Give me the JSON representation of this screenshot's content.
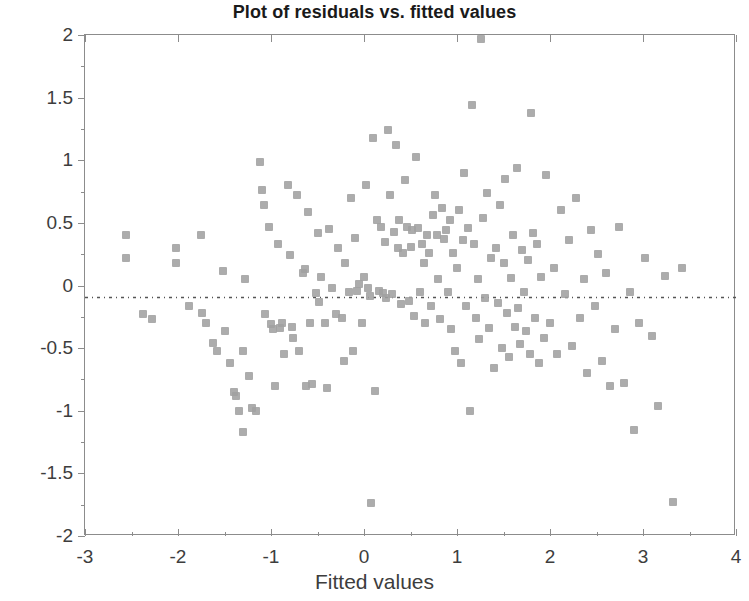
{
  "chart_data": {
    "type": "scatter",
    "title": "Plot of residuals vs. fitted values",
    "xlabel": "Fitted values",
    "ylabel": "Residuals",
    "xlim": [
      -3,
      4
    ],
    "ylim": [
      -2,
      2
    ],
    "xticks": [
      -3,
      -2,
      -1,
      0,
      1,
      2,
      3,
      4
    ],
    "xticklabels": [
      "-3",
      "-2",
      "-1",
      "0",
      "1",
      "2",
      "3",
      "4"
    ],
    "yticks": [
      -2,
      -1.5,
      -1,
      -0.5,
      0,
      0.5,
      1,
      1.5,
      2
    ],
    "yticklabels": [
      "-2",
      "-1.5",
      "-1",
      "-0.5",
      "0",
      "0.5",
      "1",
      "1.5",
      "2"
    ],
    "grid": false,
    "legend": null,
    "marker": "square",
    "marker_color": "#a0a0a0",
    "marker_size": 8,
    "reference_line": {
      "y": 0,
      "style": "dash-dot",
      "color": "#555555"
    },
    "n_points": 196,
    "points": [
      [
        -2.56,
        0.4
      ],
      [
        -2.56,
        0.22
      ],
      [
        -2.38,
        -0.23
      ],
      [
        -2.28,
        -0.27
      ],
      [
        -2.02,
        0.3
      ],
      [
        -2.02,
        0.18
      ],
      [
        -1.88,
        -0.16
      ],
      [
        -1.75,
        0.4
      ],
      [
        -1.74,
        -0.22
      ],
      [
        -1.7,
        -0.3
      ],
      [
        -1.62,
        -0.46
      ],
      [
        -1.58,
        -0.52
      ],
      [
        -1.52,
        0.12
      ],
      [
        -1.5,
        -0.36
      ],
      [
        -1.44,
        -0.62
      ],
      [
        -1.4,
        -0.85
      ],
      [
        -1.38,
        -0.88
      ],
      [
        -1.34,
        -1.0
      ],
      [
        -1.3,
        -1.17
      ],
      [
        -1.3,
        -0.52
      ],
      [
        -1.28,
        0.05
      ],
      [
        -1.24,
        -0.72
      ],
      [
        -1.2,
        -0.98
      ],
      [
        -1.16,
        -1.0
      ],
      [
        -1.12,
        0.99
      ],
      [
        -1.1,
        0.76
      ],
      [
        -1.08,
        0.64
      ],
      [
        -1.06,
        -0.23
      ],
      [
        -1.02,
        0.47
      ],
      [
        -1.0,
        -0.31
      ],
      [
        -0.98,
        -0.35
      ],
      [
        -0.96,
        -0.8
      ],
      [
        -0.93,
        0.33
      ],
      [
        -0.9,
        -0.34
      ],
      [
        -0.88,
        -0.3
      ],
      [
        -0.86,
        -0.55
      ],
      [
        -0.82,
        0.8
      ],
      [
        -0.8,
        0.24
      ],
      [
        -0.78,
        -0.33
      ],
      [
        -0.76,
        -0.42
      ],
      [
        -0.72,
        0.72
      ],
      [
        -0.7,
        -0.52
      ],
      [
        -0.66,
        0.1
      ],
      [
        -0.64,
        0.13
      ],
      [
        -0.62,
        -0.8
      ],
      [
        -0.6,
        0.59
      ],
      [
        -0.58,
        -0.3
      ],
      [
        -0.56,
        -0.79
      ],
      [
        -0.52,
        -0.06
      ],
      [
        -0.5,
        0.42
      ],
      [
        -0.48,
        -0.13
      ],
      [
        -0.46,
        0.07
      ],
      [
        -0.42,
        -0.3
      ],
      [
        -0.4,
        -0.82
      ],
      [
        -0.38,
        0.45
      ],
      [
        -0.34,
        -0.02
      ],
      [
        -0.3,
        -0.23
      ],
      [
        -0.28,
        0.3
      ],
      [
        -0.24,
        -0.26
      ],
      [
        -0.22,
        -0.6
      ],
      [
        -0.2,
        0.18
      ],
      [
        -0.16,
        -0.05
      ],
      [
        -0.14,
        0.7
      ],
      [
        -0.12,
        -0.52
      ],
      [
        -0.1,
        0.38
      ],
      [
        -0.08,
        -0.04
      ],
      [
        -0.05,
        0.01
      ],
      [
        -0.02,
        -0.3
      ],
      [
        0.0,
        0.07
      ],
      [
        0.02,
        0.8
      ],
      [
        0.04,
        -0.02
      ],
      [
        0.06,
        -0.08
      ],
      [
        0.08,
        -1.74
      ],
      [
        0.1,
        1.18
      ],
      [
        0.12,
        -0.84
      ],
      [
        0.14,
        0.52
      ],
      [
        0.16,
        -0.04
      ],
      [
        0.18,
        0.47
      ],
      [
        0.2,
        -0.06
      ],
      [
        0.22,
        0.35
      ],
      [
        0.24,
        -0.1
      ],
      [
        0.26,
        1.24
      ],
      [
        0.28,
        0.72
      ],
      [
        0.3,
        -0.07
      ],
      [
        0.32,
        0.43
      ],
      [
        0.34,
        1.12
      ],
      [
        0.36,
        0.3
      ],
      [
        0.38,
        0.52
      ],
      [
        0.4,
        -0.15
      ],
      [
        0.42,
        0.26
      ],
      [
        0.44,
        0.84
      ],
      [
        0.46,
        0.47
      ],
      [
        0.48,
        -0.12
      ],
      [
        0.5,
        0.31
      ],
      [
        0.52,
        0.44
      ],
      [
        0.54,
        -0.24
      ],
      [
        0.56,
        1.03
      ],
      [
        0.58,
        0.46
      ],
      [
        0.6,
        -0.05
      ],
      [
        0.62,
        0.33
      ],
      [
        0.64,
        0.18
      ],
      [
        0.66,
        -0.3
      ],
      [
        0.68,
        0.4
      ],
      [
        0.7,
        0.26
      ],
      [
        0.72,
        -0.16
      ],
      [
        0.74,
        0.56
      ],
      [
        0.76,
        0.72
      ],
      [
        0.78,
        0.4
      ],
      [
        0.8,
        0.05
      ],
      [
        0.82,
        -0.27
      ],
      [
        0.84,
        0.62
      ],
      [
        0.86,
        0.37
      ],
      [
        0.88,
        0.44
      ],
      [
        0.9,
        -0.05
      ],
      [
        0.92,
        0.52
      ],
      [
        0.94,
        -0.35
      ],
      [
        0.96,
        0.26
      ],
      [
        0.98,
        -0.52
      ],
      [
        1.0,
        0.14
      ],
      [
        1.02,
        0.6
      ],
      [
        1.04,
        -0.62
      ],
      [
        1.06,
        0.36
      ],
      [
        1.08,
        0.9
      ],
      [
        1.1,
        -0.16
      ],
      [
        1.12,
        0.46
      ],
      [
        1.14,
        -1.0
      ],
      [
        1.16,
        1.44
      ],
      [
        1.18,
        0.33
      ],
      [
        1.2,
        -0.26
      ],
      [
        1.22,
        0.05
      ],
      [
        1.24,
        -0.43
      ],
      [
        1.26,
        1.97
      ],
      [
        1.28,
        0.54
      ],
      [
        1.3,
        -0.1
      ],
      [
        1.32,
        0.74
      ],
      [
        1.34,
        -0.34
      ],
      [
        1.36,
        0.22
      ],
      [
        1.4,
        -0.66
      ],
      [
        1.42,
        0.3
      ],
      [
        1.44,
        -0.14
      ],
      [
        1.46,
        0.64
      ],
      [
        1.48,
        -0.5
      ],
      [
        1.5,
        0.18
      ],
      [
        1.52,
        0.85
      ],
      [
        1.54,
        -0.22
      ],
      [
        1.56,
        -0.57
      ],
      [
        1.58,
        0.06
      ],
      [
        1.6,
        0.4
      ],
      [
        1.62,
        -0.33
      ],
      [
        1.64,
        0.94
      ],
      [
        1.66,
        -0.18
      ],
      [
        1.68,
        -0.47
      ],
      [
        1.7,
        0.28
      ],
      [
        1.72,
        -0.05
      ],
      [
        1.74,
        -0.36
      ],
      [
        1.76,
        0.2
      ],
      [
        1.78,
        -0.55
      ],
      [
        1.8,
        1.38
      ],
      [
        1.82,
        0.42
      ],
      [
        1.84,
        -0.26
      ],
      [
        1.86,
        0.33
      ],
      [
        1.88,
        -0.62
      ],
      [
        1.9,
        0.07
      ],
      [
        1.94,
        -0.42
      ],
      [
        1.96,
        0.88
      ],
      [
        2.0,
        -0.3
      ],
      [
        2.04,
        0.14
      ],
      [
        2.08,
        -0.55
      ],
      [
        2.12,
        0.6
      ],
      [
        2.16,
        -0.07
      ],
      [
        2.2,
        0.36
      ],
      [
        2.24,
        -0.48
      ],
      [
        2.28,
        0.7
      ],
      [
        2.32,
        -0.26
      ],
      [
        2.36,
        0.05
      ],
      [
        2.4,
        -0.7
      ],
      [
        2.44,
        0.44
      ],
      [
        2.48,
        -0.16
      ],
      [
        2.52,
        0.25
      ],
      [
        2.56,
        -0.6
      ],
      [
        2.6,
        0.1
      ],
      [
        2.64,
        -0.8
      ],
      [
        2.7,
        -0.35
      ],
      [
        2.74,
        0.47
      ],
      [
        2.8,
        -0.78
      ],
      [
        2.86,
        -0.05
      ],
      [
        2.9,
        -1.15
      ],
      [
        2.96,
        -0.3
      ],
      [
        3.02,
        0.22
      ],
      [
        3.1,
        -0.4
      ],
      [
        3.16,
        -0.96
      ],
      [
        3.24,
        0.08
      ],
      [
        3.32,
        -1.73
      ],
      [
        3.42,
        0.14
      ]
    ]
  }
}
